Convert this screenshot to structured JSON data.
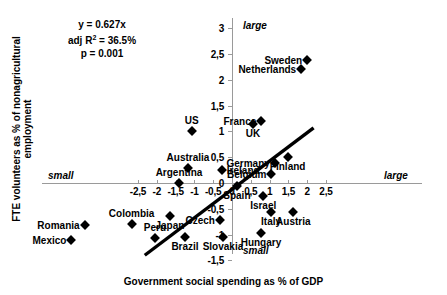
{
  "chart_data": {
    "type": "scatter",
    "title": "",
    "xlabel": "Government social spending as % of GDP",
    "ylabel": "FTE volunteers as % of nonagricultural employment",
    "xlim": [
      -2.5,
      2.5
    ],
    "ylim": [
      -1.5,
      3
    ],
    "xticks": [
      "-2,5",
      "-2",
      "-1,5",
      "-1",
      "-0,5",
      "0",
      "0,5",
      "1",
      "1,5",
      "2",
      "2,5"
    ],
    "xtick_values": [
      -2.5,
      -2,
      -1.5,
      -1,
      -0.5,
      0,
      0.5,
      1,
      1.5,
      2,
      2.5
    ],
    "yticks": [
      "3",
      "2,5",
      "2",
      "1,5",
      "1",
      "0,5",
      "0",
      "-0,5",
      "-1",
      "-1,5"
    ],
    "ytick_values": [
      3,
      2.5,
      2,
      1.5,
      1,
      0.5,
      0,
      -0.5,
      -1,
      -1.5
    ],
    "grid": false,
    "legend": null,
    "annotations": {
      "equation": "y = 0.627x",
      "r_squared_label": "adj R",
      "r_squared_sup": "2",
      "r_squared_value": "= 36.5%",
      "p_value": "p = 0.001",
      "corner_large_top": "large",
      "corner_large_right": "large",
      "corner_small_left": "small",
      "corner_small_bottom": "small"
    },
    "trendline": {
      "slope": 0.627,
      "intercept": 0,
      "x_start": -2.32,
      "y_start": -1.4,
      "x_end": 2.17,
      "y_end": 1.07
    },
    "points": [
      {
        "label": "Sweden",
        "x": 2.0,
        "y": 2.38,
        "label_pos": "left"
      },
      {
        "label": "Netherlands",
        "x": 1.84,
        "y": 2.2,
        "label_pos": "left"
      },
      {
        "label": "France",
        "x": 0.78,
        "y": 1.2,
        "label_pos": "left"
      },
      {
        "label": "UK",
        "x": 0.56,
        "y": 1.14,
        "label_pos": "below"
      },
      {
        "label": "US",
        "x": -1.07,
        "y": 1.0,
        "label_pos": "above"
      },
      {
        "label": "Finland",
        "x": 1.48,
        "y": 0.5,
        "label_pos": "below"
      },
      {
        "label": "Germany",
        "x": 1.14,
        "y": 0.38,
        "label_pos": "left"
      },
      {
        "label": "Belgium",
        "x": 1.05,
        "y": 0.17,
        "label_pos": "left"
      },
      {
        "label": "Ireland",
        "x": -0.27,
        "y": 0.25,
        "label_pos": "right"
      },
      {
        "label": "Australia",
        "x": -1.17,
        "y": 0.29,
        "label_pos": "above"
      },
      {
        "label": "Argentina",
        "x": -1.41,
        "y": 0.0,
        "label_pos": "above"
      },
      {
        "label": "Spain",
        "x": 0.13,
        "y": -0.06,
        "label_pos": "below"
      },
      {
        "label": "Israel",
        "x": 0.83,
        "y": -0.25,
        "label_pos": "below"
      },
      {
        "label": "Italy",
        "x": 1.04,
        "y": -0.56,
        "label_pos": "below"
      },
      {
        "label": "Austria",
        "x": 1.63,
        "y": -0.56,
        "label_pos": "below"
      },
      {
        "label": "Czech",
        "x": -0.32,
        "y": -0.72,
        "label_pos": "left"
      },
      {
        "label": "Slovakia",
        "x": -0.24,
        "y": -1.05,
        "label_pos": "below"
      },
      {
        "label": "Hungary",
        "x": 0.77,
        "y": -0.97,
        "label_pos": "below"
      },
      {
        "label": "Japan",
        "x": -1.65,
        "y": -0.64,
        "label_pos": "below"
      },
      {
        "label": "Peru",
        "x": -2.05,
        "y": -1.06,
        "label_pos": "above"
      },
      {
        "label": "Brazil",
        "x": -1.25,
        "y": -1.05,
        "label_pos": "below"
      },
      {
        "label": "Colombia",
        "x": -2.67,
        "y": -0.79,
        "label_pos": "above"
      },
      {
        "label": "Romania",
        "x": -3.92,
        "y": -0.81,
        "label_pos": "left"
      },
      {
        "label": "Mexico",
        "x": -4.27,
        "y": -1.11,
        "label_pos": "left"
      }
    ]
  }
}
